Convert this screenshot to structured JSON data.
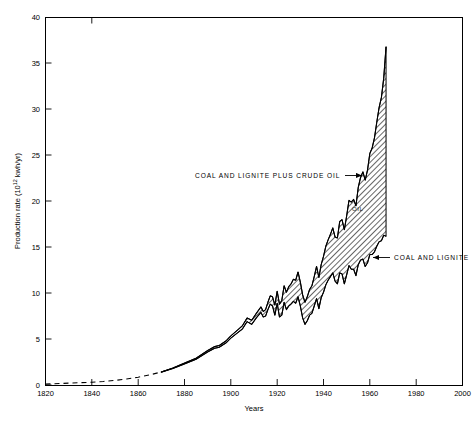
{
  "chart_data": {
    "type": "area",
    "title": "",
    "xlabel": "Years",
    "ylabel": "Production rate (10¹² kwh/yr)",
    "ylabel_parts": {
      "pre": "Production rate (10",
      "sup": "12",
      "post": " kwh/yr)"
    },
    "xlim": [
      1820,
      2000
    ],
    "ylim": [
      0,
      40
    ],
    "xticks": [
      1820,
      1840,
      1860,
      1880,
      1900,
      1920,
      1940,
      1960,
      1980,
      2000
    ],
    "yticks": [
      0,
      5,
      10,
      15,
      20,
      25,
      30,
      35,
      40
    ],
    "grid": false,
    "legend_position": "inline-annotations",
    "annotations": [
      {
        "name": "upper-band-label",
        "text": "COAL AND LIGNITE PLUS CRUDE OIL",
        "arrow": "right",
        "points_to_year": 1957,
        "points_to_value": 21.5
      },
      {
        "name": "lower-band-label",
        "text": "COAL AND LIGNITE",
        "arrow": "left",
        "points_to_year": 1965,
        "points_to_value": 15.0
      },
      {
        "name": "oil-band-inline-label",
        "text": "OIL",
        "points_to_year": 1959,
        "points_to_value": 19.5
      }
    ],
    "notes": {
      "dashed_segment": "1820-1870 estimated (dashed)",
      "solid_segment": "1870-1967 measured (solid)",
      "data_ends_year": 1967
    },
    "series": [
      {
        "name": "COAL AND LIGNITE",
        "style": "solid-lower-boundary",
        "x": [
          1820,
          1830,
          1840,
          1845,
          1850,
          1855,
          1860,
          1865,
          1870,
          1875,
          1880,
          1885,
          1890,
          1893,
          1895,
          1898,
          1900,
          1903,
          1905,
          1907,
          1909,
          1911,
          1913,
          1914,
          1915,
          1916,
          1917,
          1918,
          1919,
          1920,
          1921,
          1922,
          1923,
          1924,
          1925,
          1926,
          1927,
          1928,
          1929,
          1930,
          1931,
          1932,
          1933,
          1934,
          1935,
          1936,
          1937,
          1938,
          1939,
          1940,
          1941,
          1942,
          1943,
          1944,
          1945,
          1946,
          1947,
          1948,
          1949,
          1950,
          1951,
          1952,
          1953,
          1954,
          1955,
          1956,
          1957,
          1958,
          1959,
          1960,
          1961,
          1962,
          1963,
          1964,
          1965,
          1966,
          1967
        ],
        "values": [
          0.1,
          0.2,
          0.3,
          0.38,
          0.5,
          0.65,
          0.85,
          1.1,
          1.4,
          1.8,
          2.3,
          2.8,
          3.6,
          4.0,
          4.1,
          4.6,
          5.1,
          5.7,
          6.1,
          6.9,
          6.6,
          7.3,
          7.9,
          7.4,
          7.5,
          8.2,
          8.8,
          8.6,
          7.6,
          8.9,
          7.4,
          7.6,
          9.0,
          8.2,
          8.6,
          8.8,
          9.1,
          8.9,
          9.6,
          8.6,
          7.3,
          6.6,
          7.0,
          7.6,
          7.8,
          8.6,
          9.4,
          8.3,
          9.5,
          10.1,
          10.9,
          11.4,
          11.8,
          12.2,
          11.3,
          11.0,
          12.2,
          12.1,
          11.0,
          12.0,
          13.0,
          12.6,
          12.6,
          11.9,
          13.1,
          13.6,
          13.7,
          12.9,
          13.3,
          14.2,
          14.2,
          14.5,
          15.1,
          15.6,
          15.7,
          16.3,
          16.2
        ]
      },
      {
        "name": "COAL AND LIGNITE PLUS CRUDE OIL",
        "style": "solid-upper-boundary",
        "x": [
          1820,
          1830,
          1840,
          1845,
          1850,
          1855,
          1860,
          1865,
          1870,
          1875,
          1880,
          1885,
          1890,
          1893,
          1895,
          1898,
          1900,
          1903,
          1905,
          1907,
          1909,
          1911,
          1913,
          1914,
          1915,
          1916,
          1917,
          1918,
          1919,
          1920,
          1921,
          1922,
          1923,
          1924,
          1925,
          1926,
          1927,
          1928,
          1929,
          1930,
          1931,
          1932,
          1933,
          1934,
          1935,
          1936,
          1937,
          1938,
          1939,
          1940,
          1941,
          1942,
          1943,
          1944,
          1945,
          1946,
          1947,
          1948,
          1949,
          1950,
          1951,
          1952,
          1953,
          1954,
          1955,
          1956,
          1957,
          1958,
          1959,
          1960,
          1961,
          1962,
          1963,
          1964,
          1965,
          1966,
          1967
        ],
        "values": [
          0.1,
          0.2,
          0.3,
          0.38,
          0.5,
          0.65,
          0.85,
          1.1,
          1.42,
          1.85,
          2.38,
          2.92,
          3.75,
          4.18,
          4.3,
          4.82,
          5.35,
          6.0,
          6.45,
          7.3,
          7.05,
          7.8,
          8.5,
          8.0,
          8.2,
          9.0,
          9.7,
          9.6,
          8.7,
          10.2,
          8.8,
          9.2,
          10.8,
          10.1,
          10.7,
          11.0,
          11.5,
          11.4,
          12.3,
          11.2,
          9.8,
          9.0,
          9.6,
          10.4,
          10.8,
          11.8,
          12.9,
          11.7,
          13.1,
          14.0,
          15.1,
          15.8,
          16.4,
          17.1,
          16.1,
          16.0,
          17.8,
          18.0,
          16.9,
          18.4,
          20.1,
          19.9,
          20.2,
          19.5,
          21.5,
          22.6,
          23.2,
          22.3,
          23.4,
          25.2,
          25.8,
          26.9,
          28.6,
          30.2,
          31.3,
          33.4,
          36.8
        ]
      },
      {
        "name": "OIL (band between the two curves)",
        "style": "hatched-fill",
        "fill": "diagonal-hatch-45",
        "color": "#808080"
      }
    ]
  },
  "axes": {
    "x_tick_labels": [
      "1820",
      "1840",
      "1860",
      "1880",
      "1900",
      "1920",
      "1940",
      "1960",
      "1980",
      "2000"
    ],
    "y_tick_labels": [
      "0",
      "5",
      "10",
      "15",
      "20",
      "25",
      "30",
      "35",
      "40"
    ]
  },
  "colors": {
    "background": "#ffffff",
    "axis": "#000000",
    "curve": "#000000",
    "hatch": "#6e6e6e"
  }
}
